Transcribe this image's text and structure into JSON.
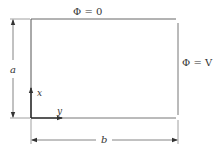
{
  "diagram": {
    "labels": {
      "top_boundary": "Φ = 0",
      "right_boundary": "Φ = V",
      "height_dim": "a",
      "width_dim": "b",
      "x_axis": "x",
      "y_axis": "y"
    },
    "colors": {
      "line": "#555555",
      "axis": "#222222",
      "text": "#333333",
      "background": "#ffffff"
    }
  }
}
